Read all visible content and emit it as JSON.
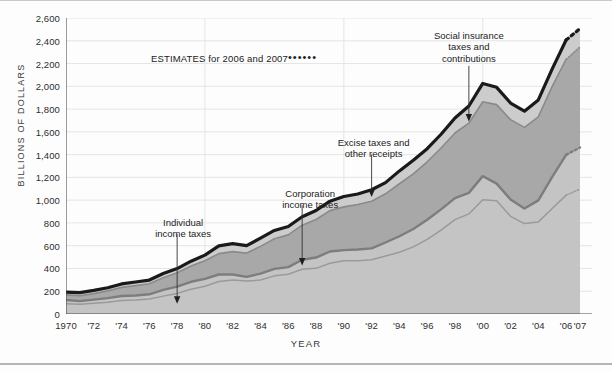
{
  "axes": {
    "y_title": "BILLIONS OF DOLLARS",
    "x_title": "YEAR",
    "y_ticks": [
      "0",
      "200",
      "400",
      "600",
      "800",
      "1,000",
      "1,200",
      "1,400",
      "1,600",
      "1,800",
      "2,000",
      "2,200",
      "2,400",
      "2,600"
    ],
    "x_ticks": [
      "1970",
      "'72",
      "'74",
      "'76",
      "'78",
      "'80",
      "'82",
      "'84",
      "'86",
      "'88",
      "'90",
      "'92",
      "'94",
      "'96",
      "'98",
      "'00",
      "'02",
      "'04",
      "'06",
      "'07"
    ]
  },
  "legend": {
    "estimates_text": "ESTIMATES for 2006 and 2007",
    "dots": "••••••"
  },
  "annotations": [
    {
      "id": "individual-income-taxes",
      "text": "Individual\nincome taxes"
    },
    {
      "id": "corporation-income-taxes",
      "text": "Corporation\nincome taxes"
    },
    {
      "id": "excise-taxes-and-other-receipts",
      "text": "Excise taxes and\nother receipts"
    },
    {
      "id": "social-insurance-taxes-and-contributions",
      "text": "Social insurance\ntaxes and\ncontributions"
    }
  ],
  "colors": {
    "total_line": "#1a1a1a",
    "band_top_fill": "#cccccc",
    "band_social_fill": "#a8a8a8",
    "band_individual_fill": "#c4c4c4",
    "white_gap": "#fbfbfb",
    "gridline": "#e2e2e2",
    "axis": "#4a4a4a"
  },
  "chart_data": {
    "type": "area",
    "title": "",
    "subtitle": "",
    "xlabel": "YEAR",
    "ylabel": "BILLIONS OF DOLLARS",
    "xlim": [
      1970,
      2007
    ],
    "ylim": [
      0,
      2600
    ],
    "grid": true,
    "legend_position": "inline-annotations",
    "stacked": true,
    "estimate_years": [
      2006,
      2007
    ],
    "x": [
      1970,
      1971,
      1972,
      1973,
      1974,
      1975,
      1976,
      1977,
      1978,
      1979,
      1980,
      1981,
      1982,
      1983,
      1984,
      1985,
      1986,
      1987,
      1988,
      1989,
      1990,
      1991,
      1992,
      1993,
      1994,
      1995,
      1996,
      1997,
      1998,
      1999,
      2000,
      2001,
      2002,
      2003,
      2004,
      2005,
      2006,
      2007
    ],
    "series": [
      {
        "name": "Individual income taxes",
        "values": [
          90,
          86,
          94,
          103,
          119,
          122,
          131,
          157,
          181,
          217,
          244,
          286,
          298,
          289,
          298,
          335,
          349,
          393,
          401,
          446,
          467,
          468,
          476,
          510,
          543,
          590,
          656,
          737,
          829,
          879,
          1004,
          994,
          858,
          794,
          809,
          927,
          1044,
          1097
        ]
      },
      {
        "name": "Corporation income taxes",
        "values": [
          33,
          27,
          32,
          36,
          39,
          41,
          42,
          55,
          60,
          66,
          65,
          61,
          49,
          37,
          57,
          61,
          63,
          84,
          95,
          103,
          94,
          98,
          100,
          118,
          140,
          157,
          172,
          182,
          189,
          185,
          207,
          151,
          148,
          132,
          189,
          278,
          354,
          365
        ]
      },
      {
        "name": "Social insurance taxes and contributions",
        "values": [
          45,
          48,
          53,
          64,
          76,
          86,
          92,
          106,
          121,
          138,
          158,
          183,
          201,
          209,
          239,
          265,
          283,
          303,
          334,
          359,
          380,
          396,
          414,
          428,
          461,
          484,
          509,
          539,
          572,
          612,
          653,
          694,
          701,
          713,
          733,
          794,
          838,
          884
        ]
      },
      {
        "name": "Excise taxes and other receipts",
        "values": [
          25,
          27,
          28,
          28,
          30,
          32,
          33,
          38,
          37,
          43,
          50,
          69,
          70,
          65,
          72,
          73,
          74,
          74,
          79,
          83,
          91,
          92,
          101,
          98,
          113,
          120,
          115,
          121,
          132,
          151,
          161,
          152,
          146,
          143,
          149,
          154,
          171,
          161
        ]
      }
    ],
    "totals": [
      193,
      188,
      207,
      231,
      263,
      279,
      298,
      356,
      399,
      463,
      517,
      599,
      618,
      601,
      666,
      734,
      769,
      854,
      909,
      991,
      1032,
      1055,
      1091,
      1154,
      1258,
      1351,
      1453,
      1579,
      1722,
      1827,
      2025,
      1991,
      1853,
      1782,
      1880,
      2154,
      2407,
      2507
    ],
    "annotations": [
      {
        "label": "Individual income taxes",
        "points_to_year": 1978
      },
      {
        "label": "Corporation income taxes",
        "points_to_year": 1987
      },
      {
        "label": "Excise taxes and other receipts",
        "points_to_year": 1992
      },
      {
        "label": "Social insurance taxes and contributions",
        "points_to_year": 1999
      }
    ]
  }
}
